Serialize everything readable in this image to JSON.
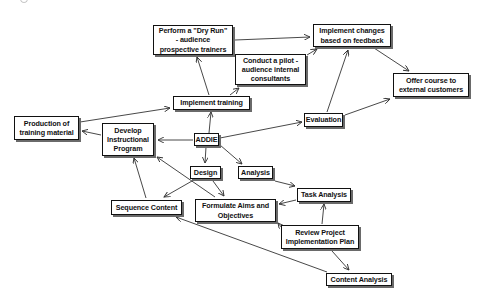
{
  "diagram": {
    "title": "ADDIE",
    "nodes": [
      {
        "id": "addie",
        "label": "ADDIE",
        "x": 194,
        "y": 133,
        "w": 25,
        "h": 13
      },
      {
        "id": "perform-dry-run",
        "label": "Perform a \"Dry Run\"\n- audience\nprospective trainers",
        "x": 153,
        "y": 25,
        "w": 80,
        "h": 30
      },
      {
        "id": "conduct-pilot",
        "label": "Conduct a pilot -\naudience internal\nconsultants",
        "x": 235,
        "y": 54,
        "w": 71,
        "h": 31
      },
      {
        "id": "implement-changes",
        "label": "Implement changes\nbased on feedback",
        "x": 313,
        "y": 24,
        "w": 78,
        "h": 23
      },
      {
        "id": "offer-course",
        "label": "Offer course to\nexternal customers",
        "x": 393,
        "y": 73,
        "w": 76,
        "h": 24
      },
      {
        "id": "implement-training",
        "label": "Implement training",
        "x": 173,
        "y": 96,
        "w": 77,
        "h": 14
      },
      {
        "id": "evaluation",
        "label": "Evaluation",
        "x": 304,
        "y": 113,
        "w": 39,
        "h": 14
      },
      {
        "id": "production",
        "label": "Production of\ntraining material",
        "x": 14,
        "y": 116,
        "w": 65,
        "h": 24
      },
      {
        "id": "develop",
        "label": "Develop\nInstructional\nProgram",
        "x": 102,
        "y": 123,
        "w": 52,
        "h": 33
      },
      {
        "id": "design",
        "label": "Design",
        "x": 190,
        "y": 166,
        "w": 31,
        "h": 13
      },
      {
        "id": "analysis",
        "label": "Analysis",
        "x": 238,
        "y": 166,
        "w": 35,
        "h": 13
      },
      {
        "id": "sequence-content",
        "label": "Sequence Content",
        "x": 111,
        "y": 200,
        "w": 71,
        "h": 15
      },
      {
        "id": "formulate-aims",
        "label": "Formulate Aims and\nObjectives",
        "x": 195,
        "y": 199,
        "w": 81,
        "h": 23
      },
      {
        "id": "task-analysis",
        "label": "Task Analysis",
        "x": 297,
        "y": 188,
        "w": 54,
        "h": 14
      },
      {
        "id": "review-plan",
        "label": "Review Project\nImplementation Plan",
        "x": 281,
        "y": 225,
        "w": 78,
        "h": 24
      },
      {
        "id": "content-analysis",
        "label": "Content Analysis",
        "x": 326,
        "y": 273,
        "w": 66,
        "h": 13
      }
    ],
    "edges": [
      {
        "from": "addie",
        "to": "implement-training",
        "x1": 209,
        "y1": 133,
        "x2": 211,
        "y2": 112
      },
      {
        "from": "addie",
        "to": "evaluation",
        "x1": 220,
        "y1": 138,
        "x2": 302,
        "y2": 122
      },
      {
        "from": "addie",
        "to": "develop",
        "x1": 193,
        "y1": 140,
        "x2": 158,
        "y2": 140
      },
      {
        "from": "addie",
        "to": "design",
        "x1": 206,
        "y1": 147,
        "x2": 205,
        "y2": 163
      },
      {
        "from": "addie",
        "to": "analysis",
        "x1": 220,
        "y1": 145,
        "x2": 242,
        "y2": 164
      },
      {
        "from": "implement-training",
        "to": "perform-dry-run",
        "x1": 209,
        "y1": 95,
        "x2": 197,
        "y2": 57
      },
      {
        "from": "implement-training",
        "to": "conduct-pilot",
        "x1": 230,
        "y1": 95,
        "x2": 239,
        "y2": 88
      },
      {
        "from": "perform-dry-run",
        "to": "implement-changes",
        "x1": 235,
        "y1": 40,
        "x2": 310,
        "y2": 37
      },
      {
        "from": "conduct-pilot",
        "to": "implement-changes",
        "x1": 307,
        "y1": 55,
        "x2": 317,
        "y2": 49
      },
      {
        "from": "evaluation",
        "to": "implement-changes",
        "x1": 327,
        "y1": 112,
        "x2": 348,
        "y2": 50
      },
      {
        "from": "evaluation",
        "to": "offer-course",
        "x1": 345,
        "y1": 115,
        "x2": 390,
        "y2": 99
      },
      {
        "from": "implement-changes",
        "to": "offer-course",
        "x1": 374,
        "y1": 48,
        "x2": 409,
        "y2": 71
      },
      {
        "from": "production",
        "to": "implement-training",
        "x1": 80,
        "y1": 122,
        "x2": 170,
        "y2": 108
      },
      {
        "from": "develop",
        "to": "production",
        "x1": 101,
        "y1": 135,
        "x2": 82,
        "y2": 131
      },
      {
        "from": "design",
        "to": "sequence-content",
        "x1": 192,
        "y1": 181,
        "x2": 164,
        "y2": 197
      },
      {
        "from": "design",
        "to": "formulate-aims",
        "x1": 213,
        "y1": 181,
        "x2": 224,
        "y2": 196
      },
      {
        "from": "sequence-content",
        "to": "develop",
        "x1": 146,
        "y1": 198,
        "x2": 134,
        "y2": 158
      },
      {
        "from": "formulate-aims",
        "to": "develop",
        "x1": 215,
        "y1": 197,
        "x2": 157,
        "y2": 157
      },
      {
        "from": "analysis",
        "to": "task-analysis",
        "x1": 275,
        "y1": 181,
        "x2": 295,
        "y2": 186
      },
      {
        "from": "task-analysis",
        "to": "formulate-aims",
        "x1": 296,
        "y1": 200,
        "x2": 279,
        "y2": 204
      },
      {
        "from": "review-plan",
        "to": "task-analysis",
        "x1": 322,
        "y1": 224,
        "x2": 324,
        "y2": 204
      },
      {
        "from": "review-plan",
        "to": "formulate-aims",
        "x1": 282,
        "y1": 228,
        "x2": 278,
        "y2": 223
      },
      {
        "from": "review-plan",
        "to": "content-analysis",
        "x1": 332,
        "y1": 251,
        "x2": 349,
        "y2": 270
      },
      {
        "from": "content-analysis",
        "to": "sequence-content",
        "x1": 327,
        "y1": 272,
        "x2": 176,
        "y2": 217
      }
    ],
    "colors": {
      "background": "#ffffff",
      "node_border": "#111111",
      "node_shadow": "#6a6a6a",
      "edge": "#333333",
      "text": "#111111"
    }
  }
}
